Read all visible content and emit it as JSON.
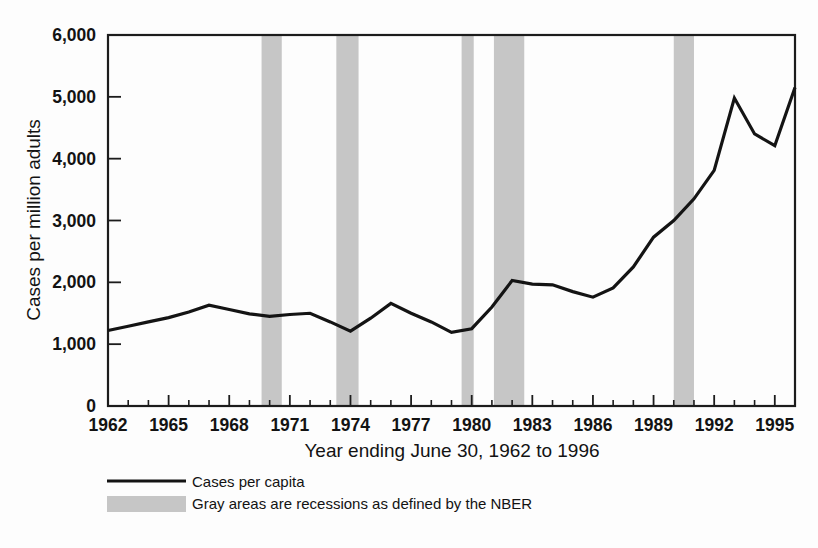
{
  "chart_data": {
    "type": "line",
    "title": "",
    "xlabel": "Year ending June 30, 1962 to 1996",
    "ylabel": "Cases per million adults",
    "xlim": [
      1962,
      1996
    ],
    "ylim": [
      0,
      6000
    ],
    "grid": false,
    "legend_position": "below-left",
    "x_tick_labels": [
      "1962",
      "1965",
      "1968",
      "1971",
      "1974",
      "1977",
      "1980",
      "1983",
      "1986",
      "1989",
      "1992",
      "1995"
    ],
    "x_tick_values": [
      1962,
      1965,
      1968,
      1971,
      1974,
      1977,
      1980,
      1983,
      1986,
      1989,
      1992,
      1995
    ],
    "x_minor_tick_step": 1,
    "y_tick_labels": [
      "0",
      "1,000",
      "2,000",
      "3,000",
      "4,000",
      "5,000",
      "6,000"
    ],
    "y_tick_values": [
      0,
      1000,
      2000,
      3000,
      4000,
      5000,
      6000
    ],
    "series": [
      {
        "name": "Cases per capita",
        "color": "#141414",
        "x": [
          1962,
          1963,
          1964,
          1965,
          1966,
          1967,
          1968,
          1969,
          1970,
          1971,
          1972,
          1973,
          1974,
          1975,
          1976,
          1977,
          1978,
          1979,
          1980,
          1981,
          1982,
          1983,
          1984,
          1985,
          1986,
          1987,
          1988,
          1989,
          1990,
          1991,
          1992,
          1993,
          1994,
          1995,
          1996
        ],
        "values": [
          1220,
          1290,
          1360,
          1430,
          1520,
          1630,
          1560,
          1490,
          1450,
          1480,
          1500,
          1360,
          1210,
          1420,
          1660,
          1500,
          1360,
          1190,
          1250,
          1600,
          2030,
          1970,
          1960,
          1850,
          1760,
          1910,
          2250,
          2730,
          3000,
          3350,
          3810,
          4980,
          4400,
          4210,
          5150
        ]
      }
    ],
    "recessions": [
      {
        "label": "1969-1970 recession",
        "start": 1969.6,
        "end": 1970.6
      },
      {
        "label": "1973-1975 recession",
        "start": 1973.3,
        "end": 1974.4
      },
      {
        "label": "1980 recession",
        "start": 1979.5,
        "end": 1980.1
      },
      {
        "label": "1981-1982 recession",
        "start": 1981.1,
        "end": 1982.6
      },
      {
        "label": "1990-1991 recession",
        "start": 1990.0,
        "end": 1991.0
      }
    ],
    "recession_color": "#c6c6c6",
    "legend": [
      {
        "key": "line",
        "label": "Cases per capita"
      },
      {
        "key": "band",
        "label": "Gray areas are recessions as defined by the NBER"
      }
    ]
  }
}
